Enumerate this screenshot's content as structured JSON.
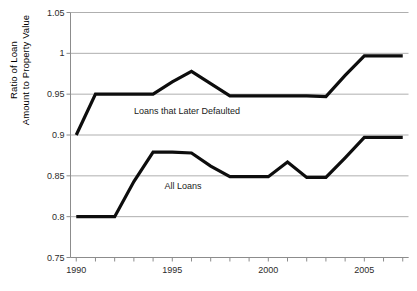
{
  "chart_data": {
    "type": "line",
    "title": "",
    "xlabel": "",
    "ylabel": "Ratio of Loan Amount to Property Value",
    "ylabel_lines": [
      "Ratio of Loan",
      "Amount to Property Value"
    ],
    "xlim": [
      1989.7,
      2007.3
    ],
    "ylim": [
      0.75,
      1.05
    ],
    "grid": "horizontal",
    "legend_position": "inline-annotations",
    "ytick_labels": [
      "1.05",
      "1",
      "0.95",
      "0.9",
      "0.85",
      "0.8",
      "0.75"
    ],
    "ytick_values": [
      1.05,
      1.0,
      0.95,
      0.9,
      0.85,
      0.8,
      0.75
    ],
    "xtick_labels": [
      "1990",
      "1995",
      "2000",
      "2005"
    ],
    "xtick_values": [
      1990,
      1995,
      2000,
      2005
    ],
    "xtick_minor_values": [
      1990,
      1991,
      1992,
      1993,
      1994,
      1995,
      1996,
      1997,
      1998,
      1999,
      2000,
      2001,
      2002,
      2003,
      2004,
      2005,
      2006,
      2007
    ],
    "x": [
      1990,
      1991,
      1992,
      1993,
      1994,
      1995,
      1996,
      1997,
      1998,
      1999,
      2000,
      2001,
      2002,
      2003,
      2004,
      2005,
      2006,
      2007
    ],
    "series": [
      {
        "name": "Loans that Later Defaulted",
        "color": "#0d0d0d",
        "values": [
          0.9,
          0.95,
          0.95,
          0.95,
          0.95,
          0.965,
          0.978,
          0.963,
          0.948,
          0.948,
          0.948,
          0.948,
          0.948,
          0.947,
          0.973,
          0.997,
          0.997,
          0.997
        ],
        "label_x": 1993.0,
        "label_y": 0.928
      },
      {
        "name": "All Loans",
        "color": "#0d0d0d",
        "values": [
          0.8,
          0.8,
          0.8,
          0.843,
          0.879,
          0.879,
          0.878,
          0.862,
          0.849,
          0.849,
          0.849,
          0.867,
          0.848,
          0.848,
          0.872,
          0.897,
          0.897,
          0.897
        ],
        "label_x": 1994.6,
        "label_y": 0.8365
      }
    ],
    "annotations": [
      {
        "text": "Loans that Later Defaulted",
        "x": 1993.0,
        "y": 0.928
      },
      {
        "text": "All Loans",
        "x": 1994.6,
        "y": 0.8365
      }
    ]
  }
}
